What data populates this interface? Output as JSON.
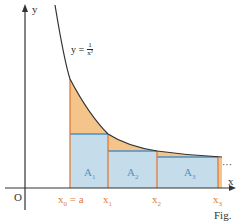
{
  "figure": {
    "type": "riemann-sum-diagram",
    "function_label": {
      "prefix": "y =",
      "numerator": "1",
      "denominator": "x²"
    },
    "axes": {
      "x_label": "x",
      "y_label": "y",
      "origin_label": "O"
    },
    "x_ticks": [
      {
        "label": "x",
        "sub": "0",
        "suffix": " = a"
      },
      {
        "label": "x",
        "sub": "1",
        "suffix": ""
      },
      {
        "label": "x",
        "sub": "2",
        "suffix": ""
      },
      {
        "label": "x",
        "sub": "3",
        "suffix": ""
      }
    ],
    "areas": [
      {
        "label": "A",
        "sub": "1"
      },
      {
        "label": "A",
        "sub": "2"
      },
      {
        "label": "A",
        "sub": "3"
      }
    ],
    "continuation": "···",
    "caption": "Fig.",
    "colors": {
      "curve": "#333333",
      "axis": "#333333",
      "rectangle_fill": "#c5dcea",
      "rectangle_top": "#4a90c8",
      "excess_fill": "#f5c48a",
      "partition_line": "#e07a3a",
      "tick_label": "#e07a3a",
      "area_label": "#5a8fc4"
    }
  }
}
